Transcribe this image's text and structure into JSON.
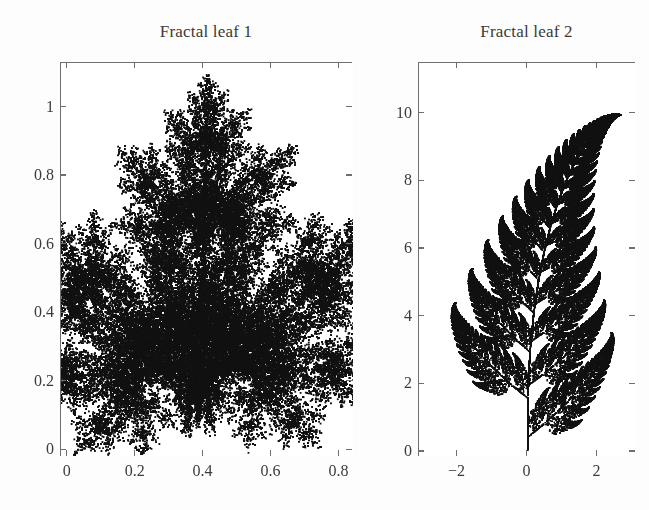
{
  "figure": {
    "background_color": "#fdfdfd",
    "axis_color": "#6f6f72",
    "point_color": "#111111",
    "text_color": "#3a3a3a"
  },
  "chart_data": [
    {
      "type": "scatter",
      "title": "Fractal leaf 1",
      "xlabel": "",
      "ylabel": "",
      "xlim": [
        -0.02,
        0.84
      ],
      "ylim": [
        -0.02,
        1.13
      ],
      "grid": false,
      "legend": "none",
      "point_count": 60000,
      "marker": "dot",
      "description": "Iterated function system attractor resembling a maple / fractal leaf silhouette",
      "xticks": [
        0,
        0.2,
        0.4,
        0.6,
        0.8
      ],
      "xticklabels": [
        "0",
        "0.2",
        "0.4",
        "0.6",
        "0.8"
      ],
      "yticks": [
        0,
        0.2,
        0.4,
        0.6,
        0.8,
        1
      ],
      "yticklabels": [
        "0",
        "0.2",
        "0.4",
        "0.6",
        "0.8",
        "1"
      ],
      "ifs": [
        {
          "a": 0.14,
          "b": 0.01,
          "c": 0.0,
          "d": 0.51,
          "e": -0.08,
          "f": -1.31,
          "p": 0.1
        },
        {
          "a": 0.43,
          "b": 0.52,
          "c": -0.45,
          "d": 0.5,
          "e": 1.49,
          "f": -0.75,
          "p": 0.35
        },
        {
          "a": 0.45,
          "b": -0.49,
          "c": 0.47,
          "d": 0.47,
          "e": -1.62,
          "f": -0.74,
          "p": 0.35
        },
        {
          "a": 0.49,
          "b": 0.0,
          "c": 0.0,
          "d": 0.51,
          "e": 0.02,
          "f": 1.62,
          "p": 0.2
        }
      ],
      "ifs_scale": {
        "sx": 0.1715,
        "ox": 0.405,
        "sy": 0.1715,
        "oy": 0.54
      },
      "extra_points": [
        [
          0.3,
          0.1
        ]
      ]
    },
    {
      "type": "scatter",
      "title": "Fractal leaf 2",
      "xlabel": "",
      "ylabel": "",
      "xlim": [
        -3.1,
        3.1
      ],
      "ylim": [
        -0.15,
        11.5
      ],
      "grid": false,
      "legend": "none",
      "point_count": 75000,
      "marker": "dot",
      "description": "Barnsley fern iterated function system attractor",
      "xticks": [
        -2,
        0,
        2
      ],
      "xticklabels": [
        "−2",
        "0",
        "2"
      ],
      "yticks": [
        0,
        2,
        4,
        6,
        8,
        10
      ],
      "yticklabels": [
        "0",
        "2",
        "4",
        "6",
        "8",
        "10"
      ],
      "ifs": [
        {
          "a": 0.0,
          "b": 0.0,
          "c": 0.0,
          "d": 0.16,
          "e": 0.0,
          "f": 0.0,
          "p": 0.01
        },
        {
          "a": 0.85,
          "b": 0.04,
          "c": -0.04,
          "d": 0.85,
          "e": 0.0,
          "f": 1.6,
          "p": 0.85
        },
        {
          "a": 0.2,
          "b": -0.26,
          "c": 0.23,
          "d": 0.22,
          "e": 0.0,
          "f": 1.6,
          "p": 0.07
        },
        {
          "a": -0.15,
          "b": 0.28,
          "c": 0.26,
          "d": 0.24,
          "e": 0.0,
          "f": 0.44,
          "p": 0.07
        }
      ],
      "ifs_scale": {
        "sx": 1.0,
        "ox": 0.0,
        "sy": 1.0,
        "oy": 0.0
      },
      "extra_points": []
    }
  ],
  "panels": [
    {
      "name": "fractal-leaf-1",
      "title": "Fractal leaf 1",
      "box": {
        "left": 60,
        "top": 62,
        "width": 292,
        "height": 394
      },
      "title_pos": {
        "left": 60,
        "top": 22,
        "width": 292
      }
    },
    {
      "name": "fractal-leaf-2",
      "title": "Fractal leaf 2",
      "box": {
        "left": 418,
        "top": 62,
        "width": 217,
        "height": 394
      },
      "title_pos": {
        "left": 418,
        "top": 22,
        "width": 217
      }
    }
  ]
}
